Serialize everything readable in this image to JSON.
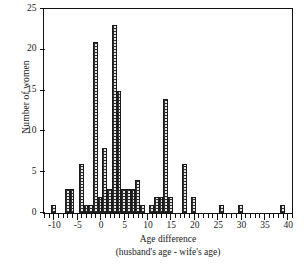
{
  "chart_data": {
    "type": "bar",
    "title": "",
    "subtitle": "",
    "xlabel": "Age difference",
    "xlabel_line2": "(husband's age - wife's age)",
    "ylabel": "Number of women",
    "xlim": [
      -12,
      41
    ],
    "ylim": [
      0,
      25
    ],
    "grid": false,
    "legend": null,
    "bin_width": 1,
    "x_major_ticks": [
      -10,
      -5,
      0,
      5,
      10,
      15,
      20,
      25,
      30,
      35,
      40
    ],
    "x_tick_labels": [
      "-10",
      "-5",
      "0",
      "5",
      "10",
      "15",
      "20",
      "25",
      "30",
      "35",
      "40"
    ],
    "x_minor_tick_step": 1,
    "y_ticks": [
      0,
      5,
      10,
      15,
      20,
      25
    ],
    "y_tick_labels": [
      "0",
      "5",
      "10",
      "15",
      "20",
      "25"
    ],
    "categories": [
      -10,
      -7,
      -6,
      -4,
      -3,
      -2,
      -1,
      0,
      1,
      2,
      3,
      4,
      5,
      6,
      7,
      8,
      9,
      11,
      12,
      13,
      14,
      15,
      18,
      20,
      26,
      30,
      39
    ],
    "values": [
      1,
      3,
      3,
      6,
      1,
      1,
      21,
      2,
      8,
      3,
      23,
      15,
      3,
      3,
      3,
      4,
      1,
      1,
      2,
      2,
      14,
      2,
      6,
      2,
      1,
      1,
      1
    ],
    "bar_fill_color": "#e6e6e6",
    "bar_edge_color": "#1b1b1b",
    "axis_color": "#111111",
    "background_color": "#ffffff"
  }
}
